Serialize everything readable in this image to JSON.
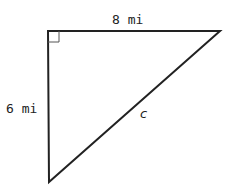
{
  "figure": {
    "type": "right-triangle",
    "labels": {
      "top_side": "8 mi",
      "left_side": "6 mi",
      "hypotenuse": "c"
    },
    "right_angle_marker": true,
    "stroke_color": "#222222"
  }
}
